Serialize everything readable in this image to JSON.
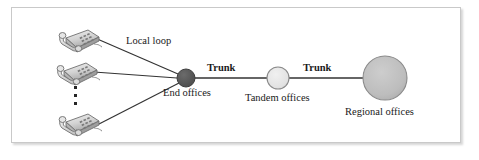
{
  "figure": {
    "background_color": "#ffffff",
    "border_color": "#c9c9c9"
  },
  "labels": {
    "local_loop": "Local loop",
    "trunk_1": "Trunk",
    "trunk_2": "Trunk",
    "end_offices": "End offices",
    "tandem_offices": "Tandem offices",
    "regional_offices": "Regional offices"
  },
  "nodes": [
    {
      "id": "end-office-node",
      "name": "End offices",
      "shape": "circle",
      "cx": 186,
      "cy": 78,
      "r": 9,
      "fill": "#585858",
      "stroke": "#3d3d3d"
    },
    {
      "id": "tandem-office-node",
      "name": "Tandem offices",
      "shape": "circle",
      "cx": 278,
      "cy": 78,
      "r": 11,
      "fill": "#e2e2e2",
      "stroke": "#8a8a8a"
    },
    {
      "id": "regional-office-node",
      "name": "Regional offices",
      "shape": "circle",
      "cx": 385,
      "cy": 78,
      "r": 22,
      "fill": "#bdbdbd",
      "stroke": "#8a8a8a"
    }
  ],
  "terminals": [
    {
      "id": "telephone-1",
      "name": "Telephone",
      "x": 58,
      "y": 24
    },
    {
      "id": "telephone-2",
      "name": "Telephone",
      "x": 56,
      "y": 57
    },
    {
      "id": "telephone-3",
      "name": "Telephone",
      "x": 58,
      "y": 108
    }
  ],
  "ellipsis": {
    "name": "vertical-ellipsis",
    "dots": 3,
    "meaning": "more telephones"
  },
  "links": [
    {
      "id": "local-loop-1",
      "label": "Local loop",
      "from": "telephone-1",
      "to": "end-office-node"
    },
    {
      "id": "local-loop-2",
      "label": "Local loop",
      "from": "telephone-2",
      "to": "end-office-node"
    },
    {
      "id": "local-loop-3",
      "label": "Local loop",
      "from": "telephone-3",
      "to": "end-office-node"
    },
    {
      "id": "trunk-link-1",
      "label": "Trunk",
      "from": "end-office-node",
      "to": "tandem-office-node"
    },
    {
      "id": "trunk-link-2",
      "label": "Trunk",
      "from": "tandem-office-node",
      "to": "regional-office-node"
    }
  ],
  "colors": {
    "line": "#333333",
    "text": "#1a1a1a",
    "end_office_fill": "#585858",
    "tandem_fill": "#e2e2e2",
    "regional_fill": "#bdbdbd"
  }
}
